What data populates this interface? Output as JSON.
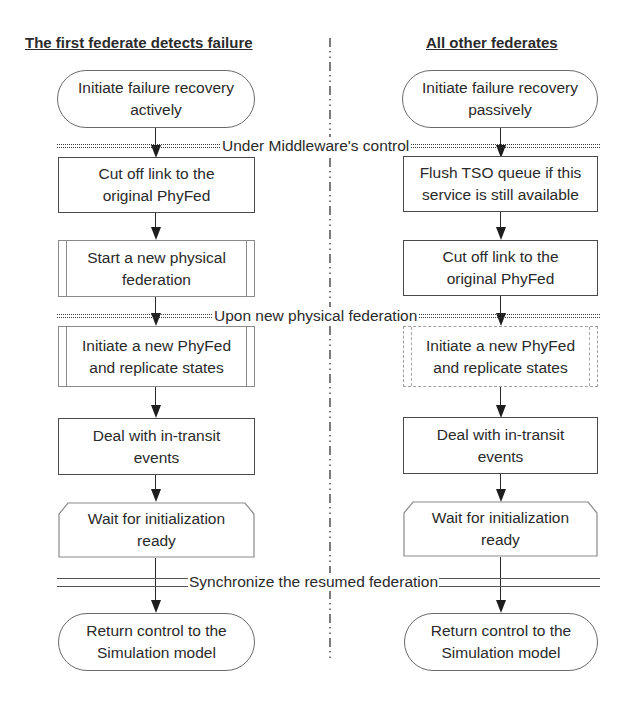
{
  "headers": {
    "left": "The first federate detects failure",
    "right": "All other federates"
  },
  "dividers": [
    {
      "label": "Under Middleware's control",
      "style": "dotted-double"
    },
    {
      "label": "Upon new physical federation",
      "style": "dotted-double"
    },
    {
      "label": "Synchronize the resumed federation",
      "style": "solid-double"
    }
  ],
  "left_column": {
    "steps": [
      {
        "text": "Initiate failure recovery\nactively",
        "shape": "terminator"
      },
      {
        "text": "Cut off link to the\noriginal PhyFed",
        "shape": "process"
      },
      {
        "text": "Start a new physical\nfederation",
        "shape": "predefined-process"
      },
      {
        "text": "Initiate  a new PhyFed\nand replicate states",
        "shape": "predefined-process"
      },
      {
        "text": "Deal with in-transit\nevents",
        "shape": "process"
      },
      {
        "text": "Wait for initialization\nready",
        "shape": "preparation"
      },
      {
        "text": "Return control to the\nSimulation model",
        "shape": "terminator"
      }
    ]
  },
  "right_column": {
    "steps": [
      {
        "text": "Initiate failure recovery\npassively",
        "shape": "terminator"
      },
      {
        "text": "Flush TSO queue if this\nservice is still available",
        "shape": "process"
      },
      {
        "text": "Cut off link to the\noriginal PhyFed",
        "shape": "process"
      },
      {
        "text": "Initiate a new PhyFed\nand replicate states",
        "shape": "predefined-process"
      },
      {
        "text": "Deal with in-transit\nevents",
        "shape": "process"
      },
      {
        "text": "Wait for initialization\nready",
        "shape": "preparation"
      },
      {
        "text": "Return control to the\nSimulation model",
        "shape": "terminator"
      }
    ]
  },
  "colors": {
    "line": "#2a2a2a",
    "text": "#2a2a2a",
    "background": "#ffffff"
  }
}
